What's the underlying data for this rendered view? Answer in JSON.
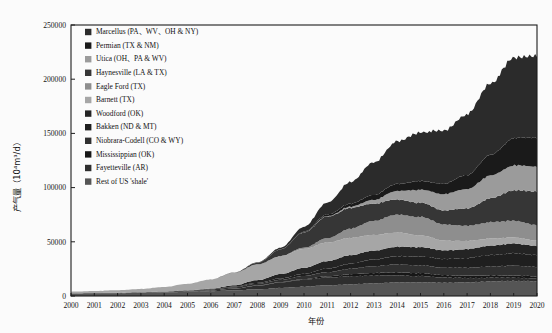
{
  "chart_data": {
    "type": "area",
    "stacked": true,
    "title": "",
    "xlabel": "年份",
    "ylabel": "产气量（10⁴m³/d）",
    "ylabel_plain": "产气量 (10^4 m3/d)",
    "xlim": [
      2000,
      2020
    ],
    "ylim": [
      0,
      250000
    ],
    "ytick_values": [
      0,
      50000,
      100000,
      150000,
      200000,
      250000
    ],
    "ytick_labels": [
      "0",
      "50000",
      "100000",
      "150000",
      "200000",
      "250000"
    ],
    "xtick_labels": [
      "2000",
      "2001",
      "2002",
      "2003",
      "2004",
      "2005",
      "2006",
      "2007",
      "2008",
      "2009",
      "2010",
      "2011",
      "2012",
      "2013",
      "2014",
      "2015",
      "2016",
      "2017",
      "2018",
      "2019",
      "2020"
    ],
    "grid": false,
    "legend_position": "upper-left-inside",
    "x": [
      2000,
      2001,
      2002,
      2003,
      2004,
      2005,
      2006,
      2007,
      2008,
      2009,
      2010,
      2011,
      2012,
      2013,
      2014,
      2015,
      2016,
      2017,
      2018,
      2019,
      2020
    ],
    "series": [
      {
        "name": "Marcellus (PA、WV、OH & NY)",
        "color": "#2b2b2b",
        "values": [
          0,
          0,
          0,
          0,
          0,
          0,
          0,
          100,
          400,
          1500,
          4500,
          11000,
          20000,
          30000,
          39000,
          45000,
          49000,
          56000,
          66000,
          74000,
          76000
        ]
      },
      {
        "name": "Permian (TX & NM)",
        "color": "#1a1a1a",
        "values": [
          0,
          0,
          0,
          0,
          0,
          0,
          0,
          0,
          0,
          200,
          600,
          1500,
          2800,
          4500,
          6500,
          8000,
          9500,
          13000,
          19000,
          25000,
          27000
        ]
      },
      {
        "name": "Utica (OH、PA & WV)",
        "color": "#9b9b9b",
        "values": [
          0,
          0,
          0,
          0,
          0,
          0,
          0,
          0,
          0,
          0,
          100,
          400,
          1200,
          3500,
          8000,
          12000,
          15000,
          18000,
          21000,
          23000,
          23000
        ]
      },
      {
        "name": "Haynesville (LA & TX)",
        "color": "#363636",
        "values": [
          0,
          0,
          0,
          0,
          0,
          0,
          0,
          200,
          1500,
          6000,
          14000,
          20000,
          19000,
          16000,
          14000,
          13000,
          13000,
          16000,
          22000,
          28000,
          31000
        ]
      },
      {
        "name": "Eagle Ford (TX)",
        "color": "#8e8e8e",
        "values": [
          0,
          0,
          0,
          0,
          0,
          0,
          0,
          0,
          0,
          100,
          1200,
          4000,
          8500,
          13000,
          16500,
          17000,
          15000,
          14000,
          15000,
          15500,
          14000
        ]
      },
      {
        "name": "Barnett (TX)",
        "color": "#a6a6a6",
        "values": [
          1500,
          1800,
          2300,
          3000,
          4200,
          6000,
          8500,
          11500,
          14500,
          16500,
          17500,
          17000,
          16000,
          14500,
          13000,
          11000,
          9000,
          7500,
          6500,
          5500,
          5000
        ]
      },
      {
        "name": "Woodford (OK)",
        "color": "#242424",
        "values": [
          0,
          0,
          0,
          0,
          0,
          100,
          400,
          1200,
          2500,
          4000,
          5500,
          7000,
          7800,
          8200,
          8800,
          8500,
          8000,
          8200,
          8800,
          9000,
          8500
        ]
      },
      {
        "name": "Bakken (ND & MT)",
        "color": "#1f1f1f",
        "values": [
          100,
          120,
          150,
          180,
          220,
          300,
          400,
          600,
          900,
          1300,
          2000,
          3200,
          4800,
          6200,
          7600,
          8200,
          8000,
          9000,
          10500,
          11500,
          11000
        ]
      },
      {
        "name": "Niobrara-Codell (CO & WY)",
        "color": "#303030",
        "values": [
          200,
          250,
          300,
          400,
          550,
          700,
          900,
          1200,
          1600,
          2100,
          2800,
          3800,
          5000,
          6200,
          7200,
          7200,
          6800,
          7200,
          8200,
          9000,
          8800
        ]
      },
      {
        "name": "Mississippian (OK)",
        "color": "#171717",
        "values": [
          0,
          0,
          0,
          0,
          0,
          0,
          0,
          100,
          200,
          400,
          700,
          1200,
          1900,
          2500,
          2900,
          2700,
          2300,
          2200,
          2200,
          2100,
          1900
        ]
      },
      {
        "name": "Fayetteville (AR)",
        "color": "#2e2e2e",
        "values": [
          0,
          0,
          0,
          0,
          100,
          300,
          700,
          1600,
          3200,
          5000,
          6400,
          7200,
          7400,
          7200,
          6600,
          5800,
          4800,
          4000,
          3400,
          2900,
          2500
        ]
      },
      {
        "name": "Rest of US 'shale'",
        "color": "#555555",
        "values": [
          2200,
          2400,
          2600,
          2900,
          3300,
          3800,
          4400,
          5200,
          6200,
          7400,
          8600,
          9800,
          10800,
          11600,
          12400,
          12600,
          12200,
          12600,
          13400,
          14000,
          13600
        ]
      }
    ]
  },
  "legend": {
    "items": [
      {
        "label": "Marcellus (PA、WV、OH & NY)",
        "swatch": "#2b2b2b"
      },
      {
        "label": "Permian (TX & NM)",
        "swatch": "#1a1a1a"
      },
      {
        "label": "Utica (OH、PA & WV)",
        "swatch": "#9b9b9b"
      },
      {
        "label": "Haynesville (LA & TX)",
        "swatch": "#363636"
      },
      {
        "label": "Eagle Ford (TX)",
        "swatch": "#8e8e8e"
      },
      {
        "label": "Barnett (TX)",
        "swatch": "#a6a6a6"
      },
      {
        "label": "Woodford (OK)",
        "swatch": "#242424"
      },
      {
        "label": "Bakken (ND & MT)",
        "swatch": "#1f1f1f"
      },
      {
        "label": "Niobrara-Codell (CO & WY)",
        "swatch": "#303030"
      },
      {
        "label": "Mississippian (OK)",
        "swatch": "#171717"
      },
      {
        "label": "Fayetteville (AR)",
        "swatch": "#2e2e2e"
      },
      {
        "label": "Rest of US 'shale'",
        "swatch": "#555555"
      }
    ]
  }
}
